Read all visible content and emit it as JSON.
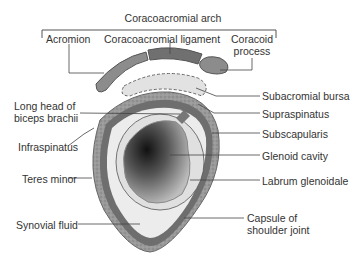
{
  "diagram": {
    "title": "Coracoacromial arch",
    "labels": {
      "acromion": "Acromion",
      "coracoacromial_ligament": "Coracoacromial ligament",
      "coracoid_process_1": "Coracoid",
      "coracoid_process_2": "process",
      "subacromial_bursa": "Subacromial bursa",
      "long_head_biceps_1": "Long head of",
      "long_head_biceps_2": "biceps brachii",
      "supraspinatus": "Supraspinatus",
      "infraspinatus": "Infraspinatus",
      "subscapularis": "Subscapularis",
      "glenoid_cavity": "Glenoid cavity",
      "teres_minor": "Teres minor",
      "labrum_glenoidale": "Labrum glenoidale",
      "synovial_fluid": "Synovial fluid",
      "capsule_1": "Capsule of",
      "capsule_2": "shoulder joint"
    },
    "colors": {
      "capsule": "#6e6e6e",
      "muscle": "#9a9a9a",
      "bone": "#8c8c8c",
      "ligament": "#707070",
      "bursa": "#e2e2e2",
      "fluid": "#ececec",
      "line": "#444444"
    }
  }
}
